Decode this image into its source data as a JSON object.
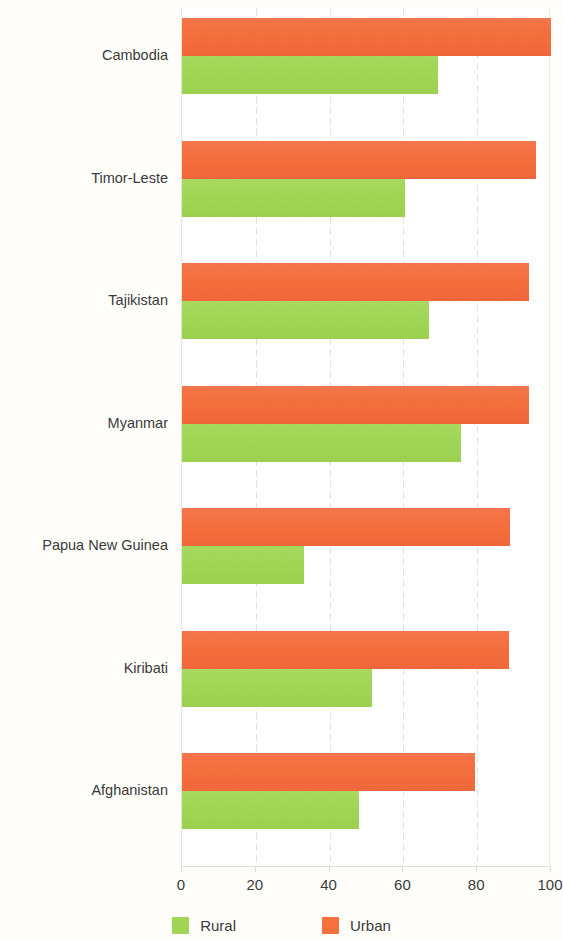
{
  "chart_data": {
    "type": "bar",
    "orientation": "horizontal",
    "title": "",
    "subtitle": "",
    "xlabel": "",
    "ylabel": "",
    "xlim": [
      0,
      100
    ],
    "xticks": [
      "0",
      "20",
      "40",
      "60",
      "80",
      "100"
    ],
    "xtick_values": [
      0,
      20,
      40,
      60,
      80,
      100
    ],
    "grid": true,
    "grid_axis": "x",
    "legend_position": "bottom-center",
    "categories": [
      "Cambodia",
      "Timor-Leste",
      "Tajikistan",
      "Myanmar",
      "Papua New Guinea",
      "Kiribati",
      "Afghanistan"
    ],
    "series": [
      {
        "name": "Urban",
        "color": "#f4713e",
        "values": [
          100,
          96,
          94,
          94,
          89,
          88.5,
          79.5
        ]
      },
      {
        "name": "Rural",
        "color": "#a1d655",
        "values": [
          69.5,
          60.5,
          67,
          75.5,
          33,
          51.5,
          48
        ]
      }
    ]
  },
  "legend": {
    "items": [
      {
        "label": "Rural",
        "color": "#a1d655",
        "swatch": "rural"
      },
      {
        "label": "Urban",
        "color": "#f4713e",
        "swatch": "urban"
      }
    ]
  },
  "colors": {
    "urban": "#f4713e",
    "rural": "#a1d655",
    "grid": "#e4e2d2",
    "text": "#3a3a3a",
    "background": "#ffffff"
  }
}
